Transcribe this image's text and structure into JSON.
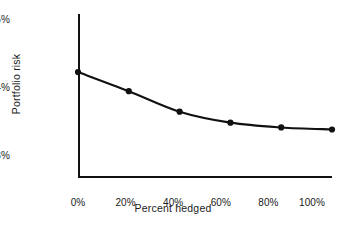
{
  "chart_data": {
    "type": "line",
    "title": "",
    "subtitle": "",
    "xlabel": "Percent hedged",
    "ylabel": "Portfolio risk",
    "x": [
      0,
      20,
      40,
      60,
      80,
      100
    ],
    "values": [
      14.15,
      13.87,
      13.57,
      13.41,
      13.34,
      13.31
    ],
    "categories": [
      "0%",
      "20%",
      "40%",
      "60%",
      "80%",
      "100%"
    ],
    "x_tick_labels": [
      "0%",
      "20%",
      "40%",
      "60%",
      "80%",
      "100%"
    ],
    "y_tick_labels": [
      "13%",
      "14%",
      "15%"
    ],
    "y_ticks": [
      13,
      14,
      15
    ],
    "xlim": [
      0,
      100
    ],
    "ylim": [
      12.6,
      15.0
    ],
    "grid": false,
    "legend": false,
    "legend_position": "none",
    "marker": "filled-circle",
    "marker_color": "#111111",
    "line_color": "#111111",
    "background_color": "#ffffff",
    "axis_color": "#111111",
    "annotations": []
  },
  "axis_titles": {
    "x": "Percent hedged",
    "y": "Portfolio risk"
  }
}
